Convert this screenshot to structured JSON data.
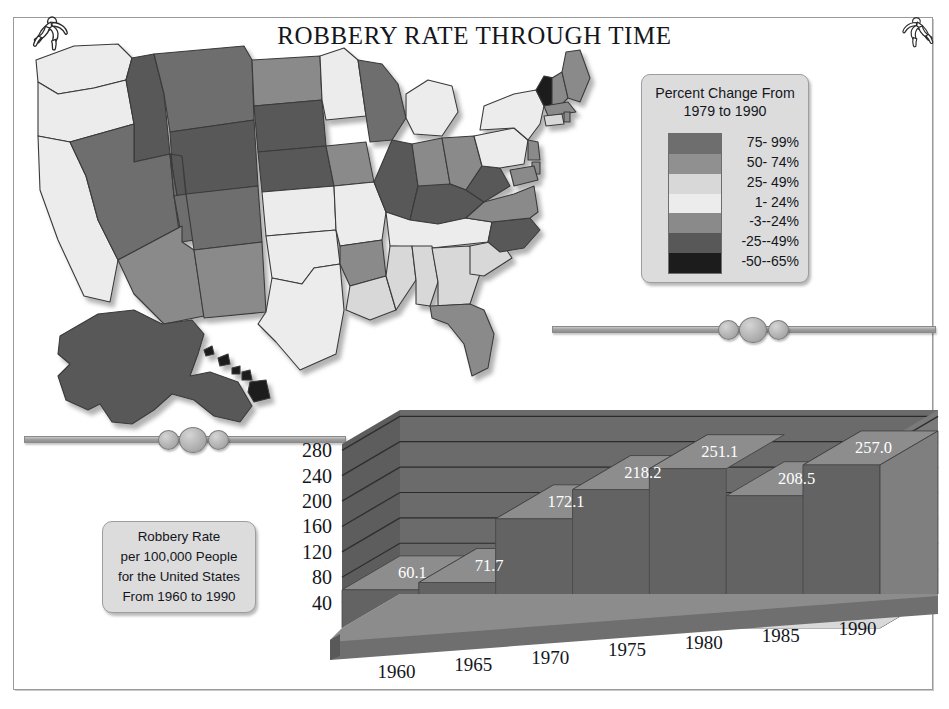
{
  "title": "ROBBERY RATE THROUGH TIME",
  "decor": {
    "runner_left": "running-figure-icon",
    "runner_right": "running-figure-icon"
  },
  "legend": {
    "title_line1": "Percent Change From",
    "title_line2": "1979 to 1990",
    "entries": [
      {
        "label": "75- 99%",
        "color": "#6e6e6e"
      },
      {
        "label": "50- 74%",
        "color": "#909090"
      },
      {
        "label": "25- 49%",
        "color": "#d8d8d8"
      },
      {
        "label": "1- 24%",
        "color": "#ececec"
      },
      {
        "label": "-3--24%",
        "color": "#8a8a8a"
      },
      {
        "label": "-25--49%",
        "color": "#585858"
      },
      {
        "label": "-50--65%",
        "color": "#1c1c1c"
      }
    ]
  },
  "caption": {
    "line1": "Robbery Rate",
    "line2": "per 100,000 People",
    "line3": "for the United States",
    "line4": "From 1960 to 1990"
  },
  "chart_data": {
    "type": "area",
    "title": "Robbery Rate per 100,000 People for the United States From 1960 to 1990",
    "categories": [
      "1960",
      "1965",
      "1970",
      "1975",
      "1980",
      "1985",
      "1990"
    ],
    "values": [
      60.1,
      71.7,
      172.1,
      218.2,
      251.1,
      208.5,
      257.0
    ],
    "value_labels": [
      "60.1",
      "71.7",
      "172.1",
      "218.2",
      "251.1",
      "208.5",
      "257.0"
    ],
    "xlabel": "",
    "ylabel": "",
    "ylim": [
      0,
      290
    ],
    "yticks": [
      280,
      240,
      200,
      160,
      120,
      80,
      40
    ],
    "ytick_labels_left": [
      "280",
      "240",
      "200",
      "160",
      "120",
      "80",
      "40"
    ],
    "ytick_labels_right": [
      "280",
      "240",
      "200",
      "160",
      "120",
      "80",
      "40"
    ],
    "grid": true,
    "legend": "none",
    "style": "3d-step-area",
    "colors": {
      "front": "#636363",
      "top": "#8d8d8d",
      "wall": "#6b6b6b",
      "floor": "#6f6f6f",
      "label": "#ffffff"
    }
  },
  "map": {
    "name": "united-states-choropleth",
    "colors": {
      "darkest": "#1c1c1c",
      "dark": "#585858",
      "mid_dark": "#6e6e6e",
      "mid": "#8a8a8a",
      "light": "#d8d8d8",
      "lightest": "#ececec",
      "stroke": "#3a3a3a"
    }
  },
  "divider": {
    "name": "ornamental-divider-bar"
  }
}
